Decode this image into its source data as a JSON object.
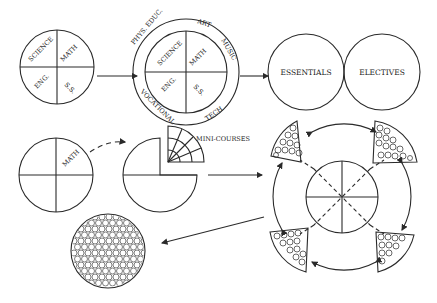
{
  "diagram": {
    "stage1": {
      "quadrants": [
        "SCIENCE",
        "MATH",
        "ENG.",
        "S.S."
      ]
    },
    "stage2": {
      "quadrants": [
        "SCIENCE",
        "MATH",
        "ENG.",
        "S.S."
      ],
      "ring_labels": [
        "PHYS. EDUC.",
        "ART",
        "MUSIC",
        "TECH",
        "VOCATIONAL"
      ]
    },
    "stage3": {
      "left_circle": "ESSENTIALS",
      "right_circle": "ELECTIVES"
    },
    "stage4": {
      "quadrant_label": "MATH"
    },
    "stage5": {
      "wedge_label": "MINI-COURSES"
    },
    "stage6": {
      "description": "Ring of four wedges filled with circles around a central circle divided into eighths"
    },
    "stage7": {
      "description": "Circle densely filled with small circles"
    },
    "colors": {
      "line": "#2a2a2a",
      "background": "#ffffff"
    }
  }
}
